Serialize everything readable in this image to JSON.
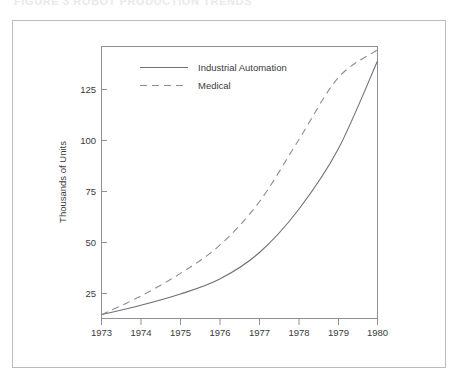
{
  "caption": {
    "text": "FIGURE 3   ROBOT PRODUCTION TRENDS"
  },
  "colors": {
    "outer_frame": "#b9bcc2",
    "axis": "#8e9196",
    "series_industrial": "#6d7075",
    "series_medical": "#8a8d92",
    "text": "#3a3a3c",
    "background": "#ffffff"
  },
  "legend": {
    "position": "top-left-inside",
    "entries": [
      {
        "label": "Industrial Automation",
        "style": "solid"
      },
      {
        "label": "Medical",
        "style": "dashed"
      }
    ]
  },
  "chart_data": {
    "type": "line",
    "title": "",
    "xlabel": "",
    "ylabel": "Thousands of Units",
    "xlim": [
      1973,
      1980
    ],
    "ylim": [
      0,
      145
    ],
    "grid": false,
    "x": [
      1973,
      1974,
      1975,
      1976,
      1977,
      1978,
      1979,
      1980
    ],
    "xtick_labels": [
      "1973",
      "1974",
      "1975",
      "1976",
      "1977",
      "1978",
      "1979",
      "1980"
    ],
    "ytick_values": [
      25,
      50,
      75,
      100,
      125
    ],
    "ytick_labels": [
      "25",
      "50",
      "75",
      "100",
      "125"
    ],
    "legend_position": "upper left",
    "series": [
      {
        "name": "Industrial Automation",
        "style": "solid",
        "values": [
          2,
          7,
          13,
          21,
          35,
          58,
          90,
          137
        ]
      },
      {
        "name": "Medical",
        "style": "dashed",
        "values": [
          2,
          12,
          24,
          39,
          62,
          95,
          128,
          143
        ]
      }
    ]
  }
}
